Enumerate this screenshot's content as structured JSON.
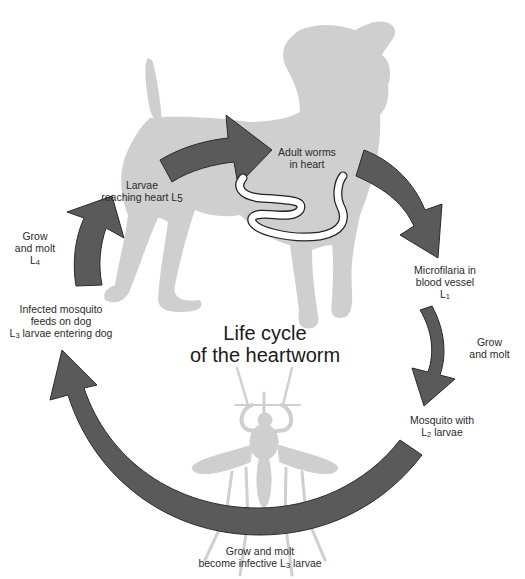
{
  "diagram": {
    "title_line1": "Life cycle",
    "title_line2": "of the heartworm",
    "colors": {
      "arrow_fill": "#5a5a5a",
      "arrow_stroke": "#2b2b2b",
      "silhouette": "#cfcfcf",
      "worm_fill": "#ffffff",
      "worm_stroke": "#222222",
      "text": "#222222",
      "background": "#ffffff"
    },
    "stages": [
      {
        "id": "adult-worms",
        "line1": "Adult worms",
        "line2": "in heart"
      },
      {
        "id": "microfilaria",
        "line1": "Microfilaria in",
        "line2": "blood vessel",
        "line3_letter": "L",
        "line3_sub": "1"
      },
      {
        "id": "grow-molt-1",
        "line1": "Grow",
        "line2": "and molt"
      },
      {
        "id": "mosquito-l2",
        "line1": "Mosquito with",
        "line2_letter": "L",
        "line2_sub": "2",
        "line2_rest": " larvae"
      },
      {
        "id": "grow-molt-infective",
        "line1": "Grow and molt",
        "line2_pre": "become infective ",
        "line2_letter": "L",
        "line2_sub": "3",
        "line2_rest": " larvae"
      },
      {
        "id": "infected-mosquito",
        "line1": "Infected mosquito",
        "line2": "feeds on dog",
        "line3_letter": "L",
        "line3_sub": "3",
        "line3_rest": " larvae entering dog"
      },
      {
        "id": "grow-molt-l4",
        "line1": "Grow",
        "line2": "and molt",
        "line3_letter": "L",
        "line3_sub": "4"
      },
      {
        "id": "larvae-heart",
        "line1": "Larvae",
        "line2_pre": "reaching heart ",
        "line2_letter": "L",
        "line2_sub": "5"
      }
    ],
    "illustrations": [
      "dog-silhouette",
      "mosquito-silhouette",
      "heartworm"
    ]
  }
}
